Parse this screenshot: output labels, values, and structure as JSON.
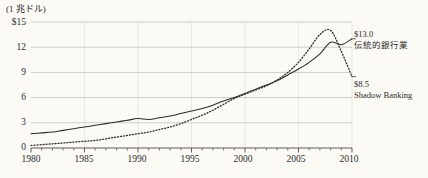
{
  "chart_data": {
    "type": "line",
    "title": "",
    "subtitle": "",
    "unit_label": "(1 兆ドル)",
    "xlabel": "",
    "ylabel": "",
    "xlim": [
      1980,
      2010
    ],
    "ylim": [
      0,
      15
    ],
    "grid": true,
    "legend_position": "right-annotations",
    "y_ticks": [
      15,
      12,
      9,
      6,
      3,
      0
    ],
    "y_tick_labels": [
      "$15",
      "12",
      "9",
      "6",
      "3",
      "0"
    ],
    "x_ticks": [
      1980,
      1985,
      1990,
      1995,
      2000,
      2005,
      2010
    ],
    "x_tick_labels": [
      "1980",
      "1985",
      "1990",
      "1995",
      "2000",
      "2005",
      "2010"
    ],
    "x_minor_tick_step": 1,
    "x": [
      1980,
      1981,
      1982,
      1983,
      1984,
      1985,
      1986,
      1987,
      1988,
      1989,
      1990,
      1991,
      1992,
      1993,
      1994,
      1995,
      1996,
      1997,
      1998,
      1999,
      2000,
      2001,
      2002,
      2003,
      2004,
      2005,
      2006,
      2007,
      2008,
      2009,
      2010
    ],
    "series": [
      {
        "name": "伝統的銀行業",
        "style": "solid",
        "color": "#2b2b2b",
        "end_value": 13.0,
        "end_label": "$13.0",
        "values": [
          1.7,
          1.8,
          1.9,
          2.1,
          2.3,
          2.5,
          2.7,
          2.9,
          3.1,
          3.3,
          3.5,
          3.4,
          3.6,
          3.8,
          4.1,
          4.4,
          4.7,
          5.1,
          5.6,
          6.0,
          6.5,
          7.0,
          7.5,
          8.0,
          8.7,
          9.4,
          10.2,
          11.2,
          12.6,
          12.3,
          13.0
        ]
      },
      {
        "name": "Shadow Banking",
        "style": "dotted",
        "color": "#2b2b2b",
        "end_value": 8.5,
        "end_label": "$8.5",
        "values": [
          0.3,
          0.4,
          0.5,
          0.6,
          0.7,
          0.8,
          0.9,
          1.1,
          1.3,
          1.5,
          1.7,
          1.9,
          2.2,
          2.5,
          2.9,
          3.4,
          3.9,
          4.5,
          5.2,
          5.9,
          6.4,
          6.9,
          7.4,
          8.1,
          9.0,
          10.2,
          11.8,
          13.5,
          14.0,
          11.5,
          8.5
        ]
      }
    ],
    "annotations": [
      {
        "value": "$13.0",
        "name": "伝統的銀行業",
        "at_year": 2010,
        "at_value": 13.0
      },
      {
        "value": "$8.5",
        "name": "Shadow Banking",
        "at_year": 2010,
        "at_value": 8.5
      }
    ]
  },
  "colors": {
    "background": "#fbfaf5",
    "grid": "#b9b9b4",
    "axis": "#4a4a46",
    "line": "#2b2b2b",
    "text": "#2b2b2b"
  }
}
